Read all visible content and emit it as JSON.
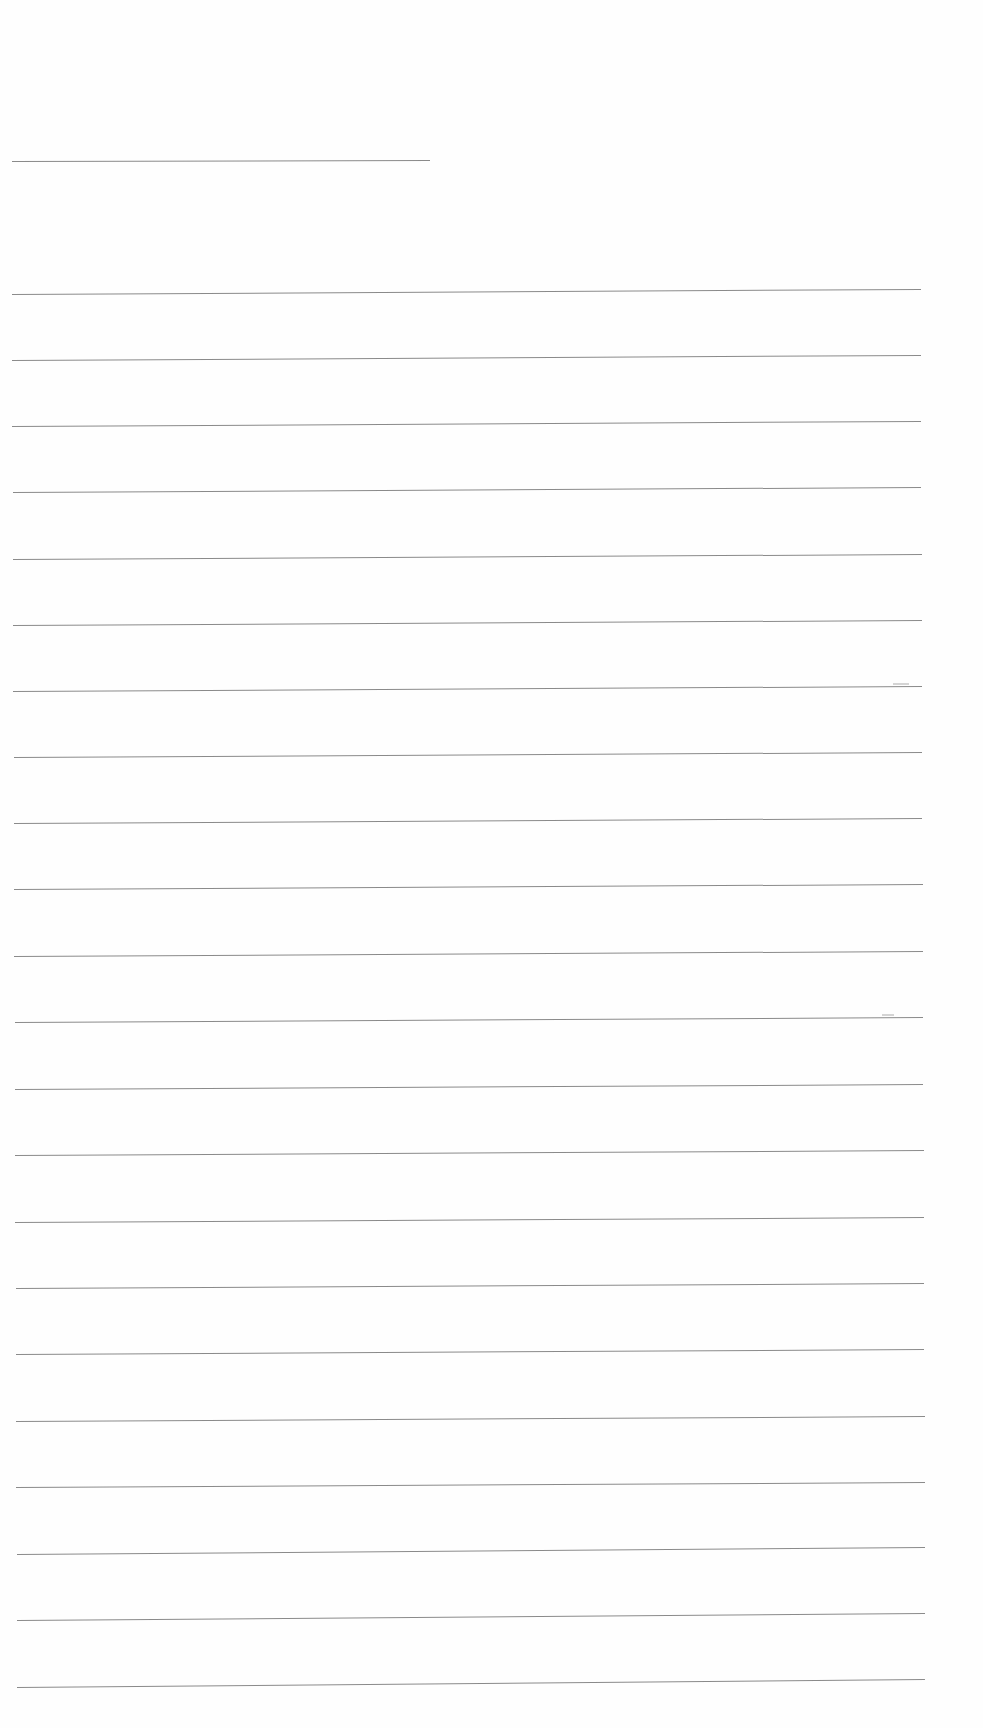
{
  "document": {
    "type": "ruled-paper",
    "background_color": "#fefefe",
    "rule_color": "#8a8a8a",
    "header_rule": {
      "x1": 12,
      "y1": 161,
      "x2": 430,
      "y2": 160
    },
    "rules": [
      {
        "x1": 12,
        "y1": 294,
        "x2": 921,
        "y2": 289
      },
      {
        "x1": 12,
        "y1": 360,
        "x2": 921,
        "y2": 355
      },
      {
        "x1": 12,
        "y1": 426,
        "x2": 921,
        "y2": 421
      },
      {
        "x1": 13,
        "y1": 492,
        "x2": 921,
        "y2": 487
      },
      {
        "x1": 13,
        "y1": 559,
        "x2": 922,
        "y2": 554
      },
      {
        "x1": 13,
        "y1": 625,
        "x2": 922,
        "y2": 620
      },
      {
        "x1": 13,
        "y1": 691,
        "x2": 922,
        "y2": 686
      },
      {
        "x1": 14,
        "y1": 757,
        "x2": 922,
        "y2": 752
      },
      {
        "x1": 14,
        "y1": 823,
        "x2": 922,
        "y2": 818
      },
      {
        "x1": 14,
        "y1": 889,
        "x2": 923,
        "y2": 884
      },
      {
        "x1": 14,
        "y1": 956,
        "x2": 923,
        "y2": 951
      },
      {
        "x1": 15,
        "y1": 1022,
        "x2": 923,
        "y2": 1017
      },
      {
        "x1": 15,
        "y1": 1089,
        "x2": 923,
        "y2": 1084
      },
      {
        "x1": 15,
        "y1": 1155,
        "x2": 924,
        "y2": 1150
      },
      {
        "x1": 15,
        "y1": 1222,
        "x2": 924,
        "y2": 1217
      },
      {
        "x1": 16,
        "y1": 1288,
        "x2": 924,
        "y2": 1283
      },
      {
        "x1": 16,
        "y1": 1354,
        "x2": 924,
        "y2": 1349
      },
      {
        "x1": 16,
        "y1": 1421,
        "x2": 925,
        "y2": 1416
      },
      {
        "x1": 16,
        "y1": 1487,
        "x2": 925,
        "y2": 1482
      },
      {
        "x1": 17,
        "y1": 1554,
        "x2": 925,
        "y2": 1547
      },
      {
        "x1": 17,
        "y1": 1620,
        "x2": 925,
        "y2": 1613
      },
      {
        "x1": 17,
        "y1": 1687,
        "x2": 925,
        "y2": 1679
      }
    ],
    "scan_marks": [
      {
        "x": 893,
        "y": 683,
        "w": 16
      },
      {
        "x": 882,
        "y": 1014,
        "w": 12
      }
    ]
  }
}
